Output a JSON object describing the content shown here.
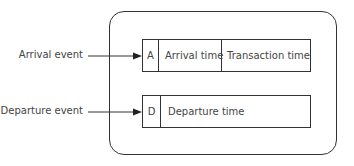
{
  "diagram": {
    "event_labels": {
      "arrival": "Arrival event",
      "departure": "Departure event"
    },
    "records": {
      "arrival": {
        "code": "A",
        "fields": [
          "Arrival time",
          "Transaction time"
        ]
      },
      "departure": {
        "code": "D",
        "fields": [
          "Departure time"
        ]
      }
    },
    "colors": {
      "line": "#333333",
      "text": "#444444",
      "background": "#ffffff"
    }
  }
}
